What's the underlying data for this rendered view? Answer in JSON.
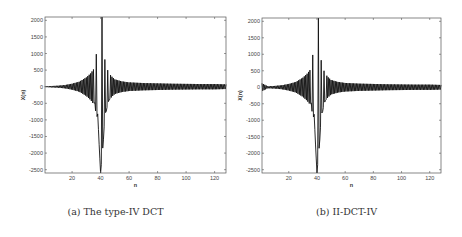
{
  "chart_data": [
    {
      "type": "line",
      "title": "",
      "caption": "(a) The type-IV DCT",
      "xlabel": "n",
      "ylabel": "X(n)",
      "xlim": [
        1,
        128
      ],
      "ylim": [
        -2600,
        2100
      ],
      "xticks": [
        20,
        40,
        60,
        80,
        100,
        120
      ],
      "yticks": [
        -2500,
        -2000,
        -1500,
        -1000,
        -500,
        0,
        500,
        1000,
        1500,
        2000
      ],
      "grid": false,
      "legend": null,
      "series": [
        {
          "name": "X(n)",
          "description": "Oscillating DCT-IV coefficients with main lobe near n=40; peak ~2100 at n=41, trough ~-2600 at n=40, side lobes +1000/-1750/-1600/+800, decaying to ~±80 tail",
          "x": [
            1,
            5,
            10,
            15,
            20,
            25,
            30,
            33,
            35,
            36,
            37,
            38,
            39,
            40,
            41,
            42,
            43,
            44,
            45,
            46,
            48,
            50,
            55,
            60,
            70,
            80,
            90,
            100,
            110,
            120,
            128
          ],
          "values": [
            10,
            20,
            30,
            50,
            90,
            150,
            280,
            400,
            520,
            -480,
            980,
            -820,
            -1750,
            -2600,
            2100,
            -1600,
            820,
            -740,
            500,
            -400,
            300,
            220,
            160,
            130,
            110,
            100,
            90,
            85,
            80,
            80,
            70
          ]
        }
      ]
    },
    {
      "type": "line",
      "title": "",
      "caption": "(b) II-DCT-IV",
      "xlabel": "n",
      "ylabel": "X(n)",
      "xlim": [
        1,
        128
      ],
      "ylim": [
        -2600,
        2100
      ],
      "xticks": [
        20,
        40,
        60,
        80,
        100,
        120
      ],
      "yticks": [
        -2500,
        -2000,
        -1500,
        -1000,
        -500,
        0,
        500,
        1000,
        1500,
        2000
      ],
      "grid": false,
      "legend": null,
      "series": [
        {
          "name": "X(n)",
          "description": "Integer DCT-IV approximation, nearly identical to (a) with small ripple at n<15 (~120 at n=1)",
          "x": [
            1,
            5,
            10,
            15,
            20,
            25,
            30,
            33,
            35,
            36,
            37,
            38,
            39,
            40,
            41,
            42,
            43,
            44,
            45,
            46,
            48,
            50,
            55,
            60,
            70,
            80,
            90,
            100,
            110,
            120,
            128
          ],
          "values": [
            120,
            30,
            40,
            60,
            100,
            160,
            290,
            410,
            520,
            -480,
            980,
            -820,
            -1750,
            -2600,
            2100,
            -1600,
            820,
            -740,
            500,
            -400,
            300,
            220,
            160,
            130,
            110,
            100,
            90,
            85,
            80,
            80,
            70
          ]
        }
      ]
    }
  ]
}
